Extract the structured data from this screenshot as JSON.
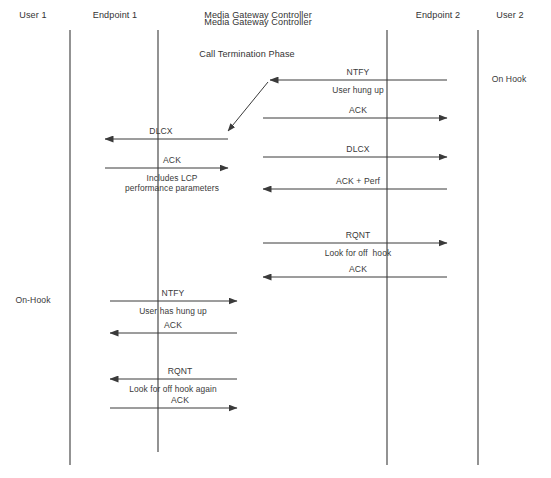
{
  "diagram": {
    "title": "Media Gateway Controller",
    "phase_title": "Call Termination Phase",
    "background_color": "#ffffff",
    "line_color": "#3a3a3a",
    "text_color": "#3a3a3a",
    "width": 551,
    "height": 478,
    "columns": [
      {
        "id": "user1",
        "label": "User 1",
        "x": 33,
        "y": 15,
        "lifeline_x": null
      },
      {
        "id": "endpoint1",
        "label": "Endpoint 1",
        "x": 115,
        "y": 15,
        "lifeline_x": 70
      },
      {
        "id": "mgc",
        "label": "Media Gateway Controller",
        "x": 258,
        "y": 15,
        "lifeline_x": 158
      },
      {
        "id": "endpoint2",
        "label": "Endpoint 2",
        "x": 438,
        "y": 15,
        "lifeline_x": 387
      },
      {
        "id": "user2",
        "label": "User 2",
        "x": 510,
        "y": 15,
        "lifeline_x": 478
      }
    ],
    "lifelines": [
      {
        "id": "lifeline-endpoint1",
        "x": 70,
        "y1": 30,
        "y2": 465
      },
      {
        "id": "lifeline-mgc",
        "x": 158,
        "y1": 30,
        "y2": 452
      },
      {
        "id": "lifeline-endpoint2",
        "x": 387,
        "y1": 30,
        "y2": 465
      },
      {
        "id": "lifeline-user2",
        "x": 478,
        "y1": 30,
        "y2": 465
      }
    ],
    "headers": [
      {
        "id": "mgc-title",
        "text": "Media Gateway Controller",
        "x": 258,
        "y": 22
      },
      {
        "id": "phase",
        "text": "Call Termination Phase",
        "x": 247,
        "y": 54
      }
    ],
    "state_labels": [
      {
        "id": "on-hook-right",
        "text": "On Hook",
        "x": 509,
        "y": 79
      },
      {
        "id": "on-hook-left",
        "text": "On-Hook",
        "x": 33,
        "y": 300
      }
    ],
    "messages": [
      {
        "id": "msg-ntfy-user-hung-up",
        "label": "NTFY",
        "sublabel": "User hung up",
        "from": "Endpoint 2",
        "to": "Media Gateway Controller",
        "direction": "left",
        "x1": 447,
        "x2": 270,
        "y": 80,
        "label_x": 358,
        "label_y": 72,
        "sub_x": 358,
        "sub_y": 90
      },
      {
        "id": "msg-diagonal",
        "label": "",
        "sublabel": "",
        "from": "Media Gateway Controller",
        "to": "Media Gateway Controller",
        "direction": "diagonal-down-left",
        "x1": 268,
        "y1": 82,
        "x2": 228,
        "y2": 131
      },
      {
        "id": "msg-ack-to-endpoint2-1",
        "label": "ACK",
        "sublabel": "",
        "from": "Media Gateway Controller",
        "to": "Endpoint 2",
        "direction": "right",
        "x1": 263,
        "x2": 447,
        "y": 118,
        "label_x": 358,
        "label_y": 110
      },
      {
        "id": "msg-dlcx-to-endpoint1",
        "label": "DLCX",
        "sublabel": "",
        "from": "Media Gateway Controller",
        "to": "Endpoint 1",
        "direction": "left",
        "x1": 228,
        "x2": 105,
        "y": 139,
        "label_x": 161,
        "label_y": 131
      },
      {
        "id": "msg-dlcx-to-endpoint2",
        "label": "DLCX",
        "sublabel": "",
        "from": "Media Gateway Controller",
        "to": "Endpoint 2",
        "direction": "right",
        "x1": 263,
        "x2": 447,
        "y": 157,
        "label_x": 358,
        "label_y": 149
      },
      {
        "id": "msg-ack-lcp",
        "label": "ACK",
        "sublabel": "Includes LCP\nperformance parameters",
        "from": "Endpoint 1",
        "to": "Media Gateway Controller",
        "direction": "right",
        "x1": 105,
        "x2": 228,
        "y": 168,
        "label_x": 172,
        "label_y": 160,
        "sub_x": 172,
        "sub_y": 183
      },
      {
        "id": "msg-ack-perf",
        "label": "ACK + Perf",
        "sublabel": "",
        "from": "Endpoint 2",
        "to": "Media Gateway Controller",
        "direction": "left",
        "x1": 447,
        "x2": 263,
        "y": 189,
        "label_x": 358,
        "label_y": 181
      },
      {
        "id": "msg-rqnt-off-hook",
        "label": "RQNT",
        "sublabel": "Look for off  hook",
        "from": "Media Gateway Controller",
        "to": "Endpoint 2",
        "direction": "right",
        "x1": 263,
        "x2": 447,
        "y": 243,
        "label_x": 358,
        "label_y": 235,
        "sub_x": 358,
        "sub_y": 253
      },
      {
        "id": "msg-ack-rqnt-right",
        "label": "ACK",
        "sublabel": "",
        "from": "Endpoint 2",
        "to": "Media Gateway Controller",
        "direction": "left",
        "x1": 447,
        "x2": 263,
        "y": 277,
        "label_x": 358,
        "label_y": 269
      },
      {
        "id": "msg-ntfy-user-has-hung-up",
        "label": "NTFY",
        "sublabel": "User has hung up",
        "from": "Endpoint 1",
        "to": "Media Gateway Controller",
        "direction": "right",
        "x1": 110,
        "x2": 237,
        "y": 301,
        "label_x": 173,
        "label_y": 293,
        "sub_x": 173,
        "sub_y": 311
      },
      {
        "id": "msg-ack-ntfy-left",
        "label": "ACK",
        "sublabel": "",
        "from": "Media Gateway Controller",
        "to": "Endpoint 1",
        "direction": "left",
        "x1": 237,
        "x2": 110,
        "y": 333,
        "label_x": 173,
        "label_y": 325
      },
      {
        "id": "msg-rqnt-off-hook-again",
        "label": "RQNT",
        "sublabel": "Look for off hook again",
        "from": "Media Gateway Controller",
        "to": "Endpoint 1",
        "direction": "left",
        "x1": 237,
        "x2": 110,
        "y": 379,
        "label_x": 180,
        "label_y": 371,
        "sub_x": 173,
        "sub_y": 389
      },
      {
        "id": "msg-ack-rqnt-left",
        "label": "ACK",
        "sublabel": "",
        "from": "Endpoint 1",
        "to": "Media Gateway Controller",
        "direction": "right",
        "x1": 110,
        "x2": 237,
        "y": 408,
        "label_x": 180,
        "label_y": 400
      }
    ]
  }
}
